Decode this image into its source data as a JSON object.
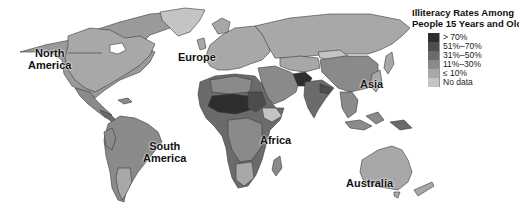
{
  "map": {
    "title_line1": "Illiteracy Rates Among",
    "title_line2": "People 15 Years and Older",
    "legend": [
      {
        "label": "> 70%",
        "color": "#2e2e2e"
      },
      {
        "label": "51%–70%",
        "color": "#4d4d4d"
      },
      {
        "label": "31%–50%",
        "color": "#6b6b6b"
      },
      {
        "label": "11%–30%",
        "color": "#8a8a8a"
      },
      {
        "label": "≤ 10%",
        "color": "#a8a8a8"
      },
      {
        "label": "No data",
        "color": "#c4c4c4"
      }
    ],
    "continent_labels": {
      "north_america_1": "North",
      "north_america_2": "America",
      "europe": "Europe",
      "asia": "Asia",
      "south_america_1": "South",
      "south_america_2": "America",
      "africa": "Africa",
      "australia": "Australia"
    }
  }
}
